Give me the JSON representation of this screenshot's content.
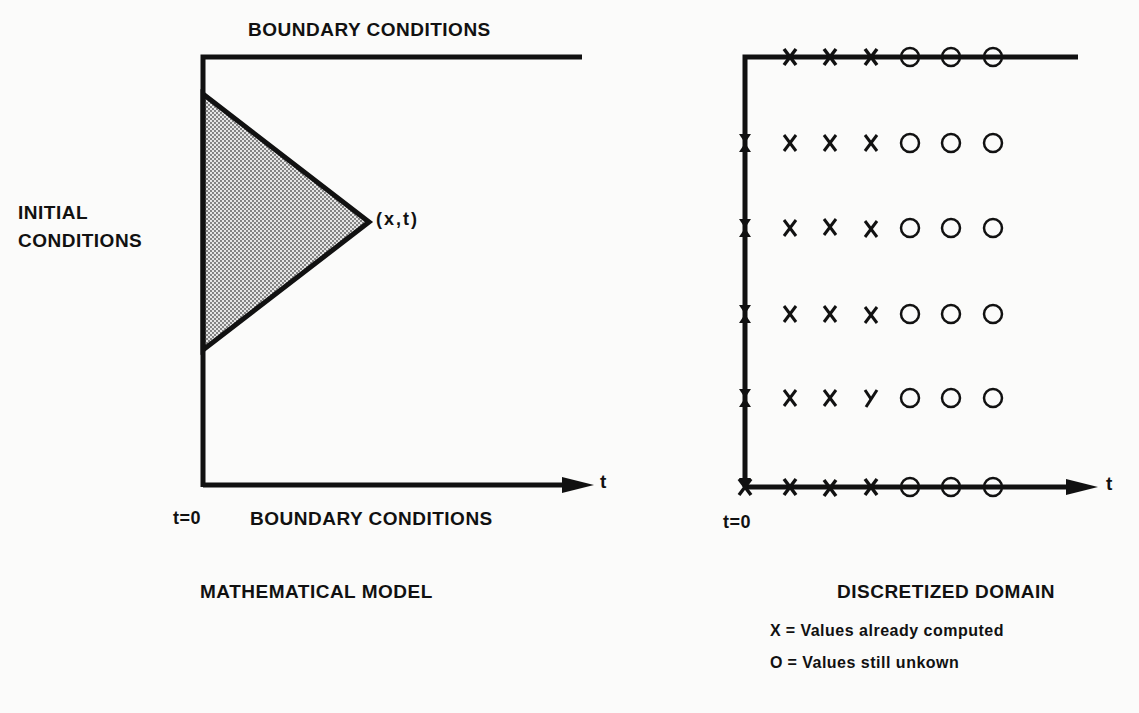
{
  "left_panel": {
    "top_label": "BOUNDARY CONDITIONS",
    "left_label_line1": "INITIAL",
    "left_label_line2": "CONDITIONS",
    "point_label": "(x,t)",
    "axis_label": "t",
    "origin_label": "t=0",
    "bottom_label": "BOUNDARY CONDITIONS",
    "caption": "MATHEMATICAL MODEL"
  },
  "right_panel": {
    "axis_label": "t",
    "origin_label": "t=0",
    "caption": "DISCRETIZED DOMAIN",
    "legend": [
      {
        "symbol": "X",
        "text": "= Values  already computed"
      },
      {
        "symbol": "O",
        "text": "= Values  still unkown"
      }
    ],
    "grid": {
      "columns_x": [
        790,
        830,
        871,
        910,
        951,
        993
      ],
      "rows_y": [
        57,
        143,
        228,
        314,
        398,
        487
      ],
      "column_types": [
        "X",
        "X",
        "X",
        "O",
        "O",
        "O"
      ],
      "row_labels": [
        "boundary-top",
        "interior",
        "interior",
        "interior",
        "interior",
        "boundary-bottom"
      ]
    }
  },
  "colors": {
    "ink": "#111111",
    "background": "#fbfbfa",
    "stipple": "#9a9a9a"
  }
}
